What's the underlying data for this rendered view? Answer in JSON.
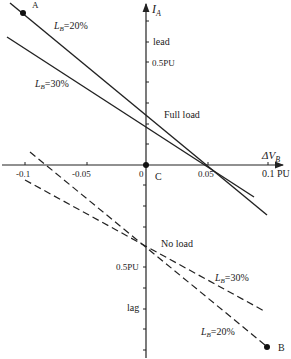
{
  "diagram": {
    "axes": {
      "y_label": "I",
      "y_label_sub": "A",
      "x_label_prefix": "ΔV",
      "x_label_sub": "B",
      "origin_label": "C",
      "x_ticks": [
        "-0.1",
        "-0.05",
        "0",
        "0.05",
        "0.1 PU"
      ],
      "y_upper_labels": [
        "lead",
        "0.5PU"
      ],
      "y_lower_labels": [
        "0.5PU",
        "lag"
      ]
    },
    "annotations": {
      "full_load": "Full load",
      "no_load": "No load",
      "point_a": "A",
      "point_b": "B"
    },
    "series_labels": {
      "solid_20_prefix": "L",
      "solid_20_sub": "B",
      "solid_20_value": "=20%",
      "solid_30_prefix": "L",
      "solid_30_sub": "B",
      "solid_30_value": "=30%",
      "dashed_30_prefix": "L",
      "dashed_30_sub": "B",
      "dashed_30_value": "=30%",
      "dashed_20_prefix": "L",
      "dashed_20_sub": "B",
      "dashed_20_value": "=20%"
    },
    "colors": {
      "line": "#222222",
      "background": "#ffffff"
    }
  }
}
